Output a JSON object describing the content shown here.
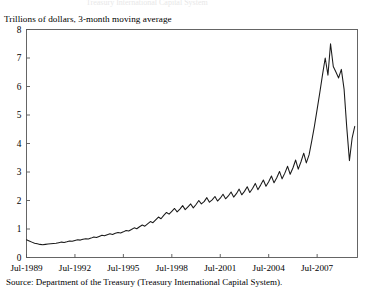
{
  "figure": {
    "cut_off_title": "Treasury International Capital System",
    "subtitle": "Trillions of dollars, 3-month moving average",
    "source": "Source:  Department of the Treasury (Treasury International Capital System).",
    "line_color": "#1a1a1a",
    "axis_color": "#555555",
    "background": "#ffffff"
  },
  "chart_data": {
    "type": "line",
    "title": "",
    "subtitle": "Trillions of dollars, 3-month moving average",
    "xlabel": "",
    "ylabel": "Trillions of dollars, 3-month moving average",
    "grid": false,
    "legend": false,
    "ylim": [
      0,
      8
    ],
    "ytick_labels": [
      "0",
      "1",
      "2",
      "3",
      "4",
      "5",
      "6",
      "7",
      "8"
    ],
    "yticks": [
      0,
      1,
      2,
      3,
      4,
      5,
      6,
      7,
      8
    ],
    "xlim": [
      "Jul-1989",
      "Jan-2010"
    ],
    "xtick_labels": [
      "Jul-1989",
      "Jul-1992",
      "Jul-1995",
      "Jul-1998",
      "Jul-2001",
      "Jul-2004",
      "Jul-2007"
    ],
    "xticks": [
      1989.5,
      1992.5,
      1995.5,
      1998.5,
      2001.5,
      2004.5,
      2007.5
    ],
    "series": [
      {
        "name": "Cross-border securities transactions",
        "x": [
          1989.5,
          1989.67,
          1989.83,
          1990.0,
          1990.17,
          1990.33,
          1990.5,
          1990.67,
          1990.83,
          1991.0,
          1991.17,
          1991.33,
          1991.5,
          1991.67,
          1991.83,
          1992.0,
          1992.17,
          1992.33,
          1992.5,
          1992.67,
          1992.83,
          1993.0,
          1993.17,
          1993.33,
          1993.5,
          1993.67,
          1993.83,
          1994.0,
          1994.17,
          1994.33,
          1994.5,
          1994.67,
          1994.83,
          1995.0,
          1995.17,
          1995.33,
          1995.5,
          1995.67,
          1995.83,
          1996.0,
          1996.17,
          1996.33,
          1996.5,
          1996.67,
          1996.83,
          1997.0,
          1997.17,
          1997.33,
          1997.5,
          1997.67,
          1997.83,
          1998.0,
          1998.17,
          1998.33,
          1998.5,
          1998.67,
          1998.83,
          1999.0,
          1999.17,
          1999.33,
          1999.5,
          1999.67,
          1999.83,
          2000.0,
          2000.17,
          2000.33,
          2000.5,
          2000.67,
          2000.83,
          2001.0,
          2001.17,
          2001.33,
          2001.5,
          2001.67,
          2001.83,
          2002.0,
          2002.17,
          2002.33,
          2002.5,
          2002.67,
          2002.83,
          2003.0,
          2003.17,
          2003.33,
          2003.5,
          2003.67,
          2003.83,
          2004.0,
          2004.17,
          2004.33,
          2004.5,
          2004.67,
          2004.83,
          2005.0,
          2005.17,
          2005.33,
          2005.5,
          2005.67,
          2005.83,
          2006.0,
          2006.17,
          2006.33,
          2006.5,
          2006.67,
          2006.83,
          2007.0,
          2007.17,
          2007.33,
          2007.5,
          2007.67,
          2007.83,
          2008.0,
          2008.17,
          2008.33,
          2008.5,
          2008.67,
          2008.83,
          2009.0,
          2009.17,
          2009.33,
          2009.5,
          2009.67,
          2009.83
        ],
        "y": [
          0.62,
          0.58,
          0.54,
          0.5,
          0.48,
          0.46,
          0.45,
          0.46,
          0.47,
          0.48,
          0.49,
          0.5,
          0.52,
          0.54,
          0.53,
          0.55,
          0.58,
          0.57,
          0.6,
          0.62,
          0.61,
          0.64,
          0.66,
          0.65,
          0.68,
          0.72,
          0.7,
          0.74,
          0.78,
          0.76,
          0.8,
          0.83,
          0.81,
          0.85,
          0.88,
          0.86,
          0.9,
          0.95,
          0.93,
          0.98,
          1.04,
          1.01,
          1.08,
          1.14,
          1.1,
          1.18,
          1.26,
          1.22,
          1.32,
          1.42,
          1.36,
          1.48,
          1.58,
          1.52,
          1.62,
          1.72,
          1.6,
          1.7,
          1.82,
          1.68,
          1.78,
          1.88,
          1.74,
          1.86,
          2.0,
          1.88,
          1.96,
          2.1,
          1.94,
          2.02,
          2.14,
          1.98,
          2.08,
          2.22,
          2.06,
          2.16,
          2.3,
          2.12,
          2.24,
          2.4,
          2.2,
          2.32,
          2.48,
          2.28,
          2.42,
          2.6,
          2.38,
          2.54,
          2.72,
          2.5,
          2.66,
          2.86,
          2.62,
          2.8,
          3.02,
          2.76,
          2.96,
          3.2,
          2.92,
          3.14,
          3.42,
          3.1,
          3.36,
          3.66,
          3.32,
          3.6,
          4.1,
          4.6,
          5.2,
          5.8,
          6.4,
          7.0,
          6.4,
          7.5,
          6.7,
          6.5,
          6.3,
          6.6,
          5.9,
          4.6,
          3.4,
          4.2,
          4.6
        ]
      }
    ],
    "annotations": [
      {
        "label": "peak",
        "x": 2008.17,
        "y": 7.5
      },
      {
        "label": "trough after crash",
        "x": 2009.0,
        "y": 3.4
      },
      {
        "label": "final value",
        "x": 2009.83,
        "y": 4.6
      },
      {
        "label": "initial value",
        "x": 1989.5,
        "y": 0.62
      },
      {
        "label": "early minimum",
        "x": 1990.5,
        "y": 0.45
      }
    ]
  }
}
